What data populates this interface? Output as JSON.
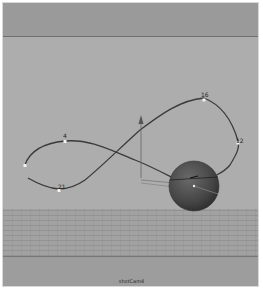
{
  "viewport": {
    "camera_name": "shotCam4",
    "background_color": "#adadad",
    "band_color": "#9a9a9a"
  },
  "scene": {
    "curve": {
      "name": "motion-path",
      "color": "#3c3c3c",
      "points": [
        {
          "label": "4",
          "x": 65,
          "y": 141
        },
        {
          "label": "16",
          "x": 204,
          "y": 100
        },
        {
          "label": "12",
          "x": 238,
          "y": 143
        },
        {
          "label": "21",
          "x": 59,
          "y": 189
        }
      ]
    },
    "sphere": {
      "cx": 194,
      "cy": 186,
      "r": 25,
      "color": "#4a4a4a"
    },
    "locator_icon": "up-arrow-manipulator"
  }
}
